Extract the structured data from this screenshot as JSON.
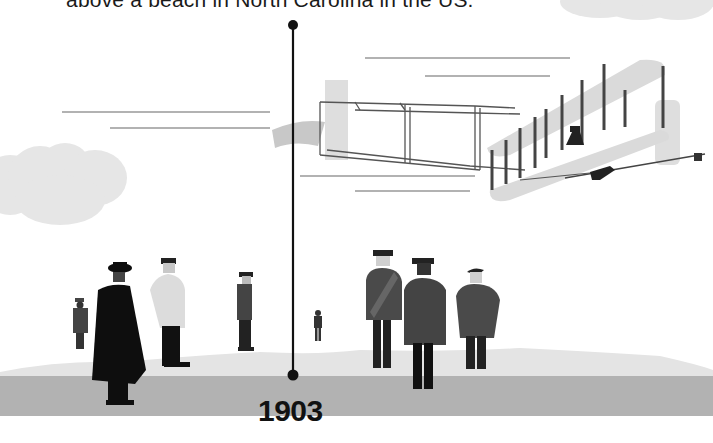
{
  "caption": {
    "text": "above a beach in North Carolina in the US."
  },
  "timeline": {
    "year": "1903",
    "line_color": "#111111"
  },
  "scene": {
    "description": "Wright Flyer first powered flight illustration with onlookers",
    "elements": [
      "clouds",
      "speed-lines",
      "biplane",
      "pilot",
      "onlookers",
      "sand-dunes",
      "ground"
    ],
    "colors": {
      "sky": "#ffffff",
      "cloud": "#e6e6e6",
      "dune": "#e4e4e4",
      "ground": "#b2b2b2",
      "wing": "#d9d9d9",
      "strut": "#444444",
      "figure_dark": "#111111",
      "figure_mid": "#444444",
      "figure_light": "#dcdcdc"
    }
  }
}
